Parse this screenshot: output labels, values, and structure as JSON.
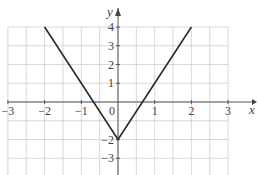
{
  "chart_data": {
    "type": "line",
    "title": "",
    "xlabel": "x",
    "ylabel": "y",
    "xlim": [
      -3,
      3
    ],
    "ylim": [
      -3.9,
      4
    ],
    "grid": true,
    "x_grid_step": 0.5,
    "y_grid_step": 1,
    "origin_label": "0",
    "x_ticks": [
      -3,
      -2,
      -1,
      1,
      2,
      3
    ],
    "x_tick_labels": [
      "−3",
      "−2",
      "−1",
      "1",
      "2",
      "3"
    ],
    "y_ticks": [
      4,
      3,
      2,
      1,
      -2,
      -3
    ],
    "y_tick_labels": [
      "4",
      "3",
      "2",
      "1",
      "−2",
      "−3"
    ],
    "series": [
      {
        "name": "y = 3|x| − 2",
        "x": [
          -2,
          0,
          2
        ],
        "y": [
          4,
          -2,
          4
        ]
      }
    ]
  }
}
